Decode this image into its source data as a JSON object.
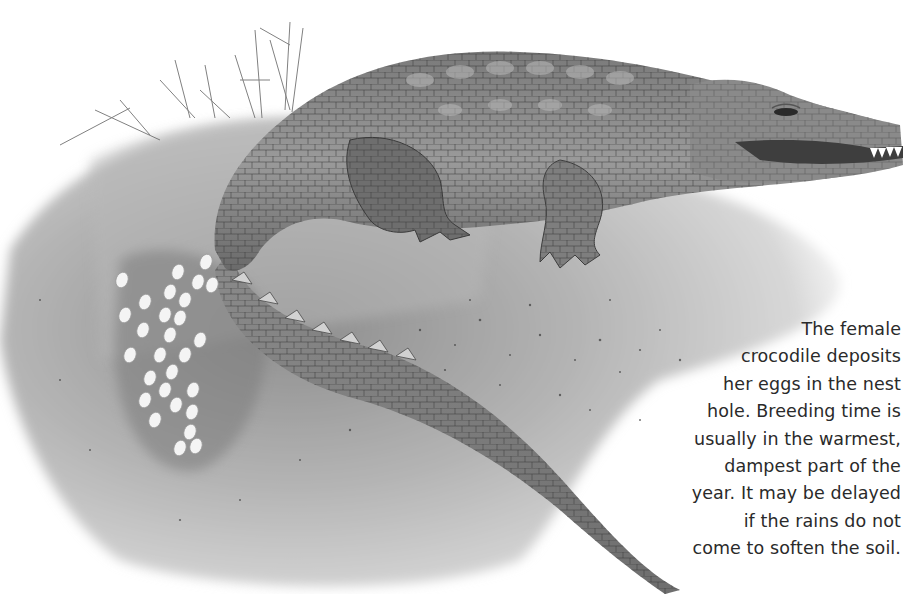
{
  "illustration": {
    "subject": "Female crocodile lying on a nest mound beside a clutch of white eggs",
    "style": "grayscale painted illustration",
    "colors": {
      "background": "#ffffff",
      "mound_light": "#cfcfcf",
      "mound_dark": "#8a8a8a",
      "crocodile_body": "#8c8c8c",
      "crocodile_dark": "#4a4a4a",
      "eggs": "#f4f4f4",
      "text": "#2a2a2a"
    }
  },
  "caption": {
    "lines": [
      "The female",
      "crocodile deposits",
      "her eggs in the nest",
      "hole. Breeding time is",
      "usually in the warmest,",
      "dampest part of the",
      "year. It may be delayed",
      "if the rains do not",
      "come to soften the soil."
    ]
  }
}
